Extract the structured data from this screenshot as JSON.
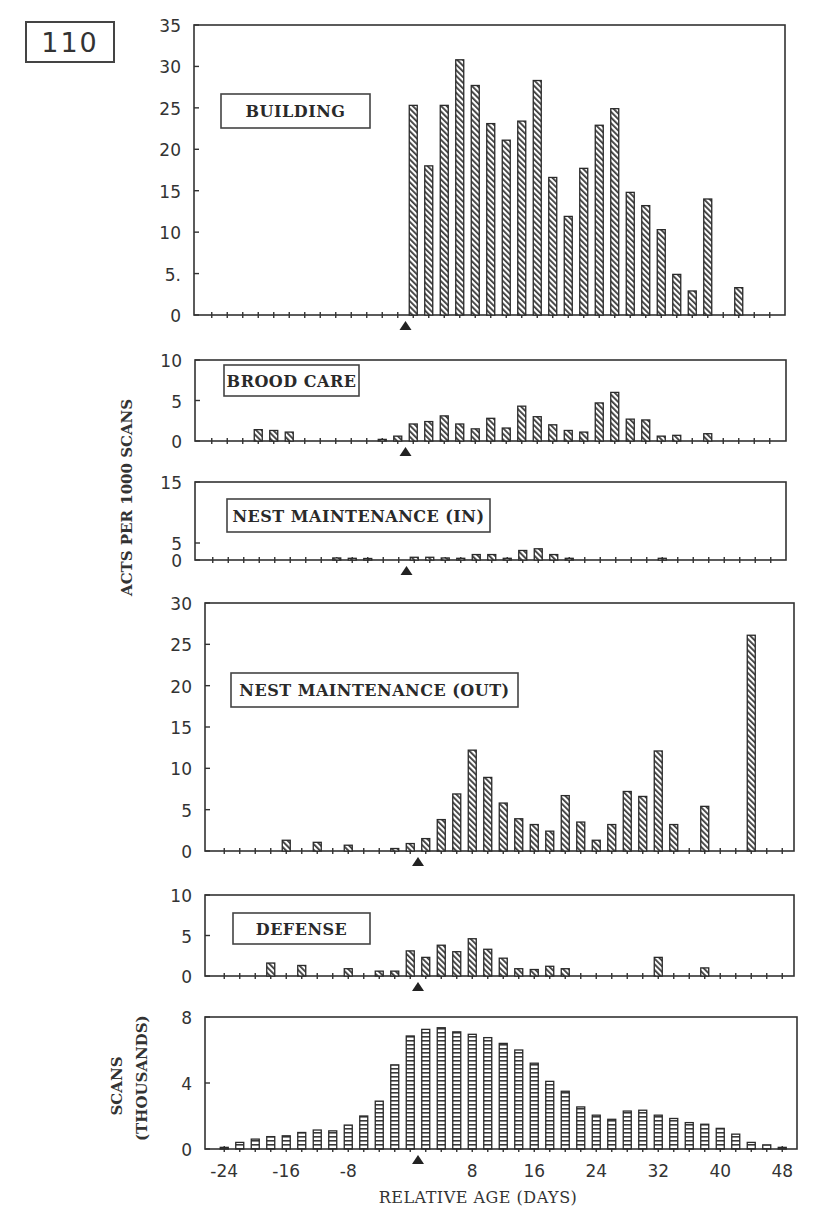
{
  "figure": {
    "number": "110",
    "y_axis_title": "ACTS PER 1000 SCANS",
    "scans_axis_title_line1": "SCANS",
    "scans_axis_title_line2": "(THOUSANDS)",
    "x_axis_title": "RELATIVE AGE (DAYS)",
    "colors": {
      "ink": "#333333",
      "bar_fill": "#ffffff",
      "hatch": "#444444",
      "background": "#ffffff"
    }
  },
  "chart_data": [
    {
      "type": "bar",
      "title": "BUILDING",
      "xlabel": "",
      "ylabel": "ACTS PER 1000 SCANS",
      "ylim": [
        0,
        35
      ],
      "yticks": [
        "0",
        "5.",
        "10",
        "15",
        "20",
        "25",
        "30",
        "35"
      ],
      "grid": false,
      "marker_day": 1,
      "x": [
        2,
        4,
        6,
        8,
        10,
        12,
        14,
        16,
        18,
        20,
        22,
        24,
        26,
        28,
        30,
        32,
        34,
        36,
        38,
        40,
        44
      ],
      "values": [
        25.3,
        18.0,
        25.3,
        30.8,
        27.7,
        23.1,
        21.1,
        23.4,
        28.3,
        16.6,
        11.9,
        17.7,
        22.9,
        24.9,
        14.8,
        13.2,
        10.3,
        4.9,
        2.9,
        14.0,
        3.3
      ]
    },
    {
      "type": "bar",
      "title": "BROOD CARE",
      "ylim": [
        0,
        10
      ],
      "yticks": [
        "0",
        "5",
        "10"
      ],
      "grid": false,
      "marker_day": 1,
      "x": [
        -18,
        -16,
        -14,
        -2,
        0,
        2,
        4,
        6,
        8,
        10,
        12,
        14,
        16,
        18,
        20,
        22,
        24,
        26,
        28,
        30,
        32,
        34,
        36,
        40
      ],
      "values": [
        1.4,
        1.3,
        1.1,
        0.2,
        0.6,
        2.1,
        2.4,
        3.1,
        2.1,
        1.5,
        2.8,
        1.6,
        4.3,
        3.0,
        2.0,
        1.3,
        1.1,
        4.7,
        6.0,
        2.7,
        2.6,
        0.6,
        0.7,
        0.9
      ]
    },
    {
      "type": "bar",
      "title": "NEST MAINTENANCE (IN)",
      "ylim": [
        0,
        15
      ],
      "yticks": [
        "0",
        "5",
        "15"
      ],
      "grid": false,
      "marker_day": 1,
      "x": [
        -8,
        -6,
        -4,
        2,
        4,
        6,
        8,
        10,
        12,
        14,
        16,
        18,
        20,
        22,
        34
      ],
      "values": [
        0.6,
        0.5,
        0.4,
        0.8,
        0.8,
        0.6,
        0.5,
        1.6,
        1.6,
        0.5,
        2.8,
        3.3,
        1.6,
        0.5,
        0.5
      ]
    },
    {
      "type": "bar",
      "title": "NEST MAINTENANCE (OUT)",
      "ylim": [
        0,
        30
      ],
      "yticks": [
        "0",
        "5",
        "10",
        "15",
        "20",
        "25",
        "30"
      ],
      "grid": false,
      "marker_day": 1,
      "x": [
        -16,
        -12,
        -8,
        -2,
        0,
        2,
        4,
        6,
        8,
        10,
        12,
        14,
        16,
        18,
        20,
        22,
        24,
        26,
        28,
        30,
        32,
        34,
        38,
        44
      ],
      "values": [
        1.3,
        1.05,
        0.7,
        0.3,
        0.9,
        1.5,
        3.8,
        6.9,
        12.2,
        8.9,
        5.8,
        3.9,
        3.2,
        2.4,
        6.7,
        3.5,
        1.3,
        3.2,
        7.2,
        6.6,
        12.1,
        3.2,
        5.4,
        26.1
      ]
    },
    {
      "type": "bar",
      "title": "DEFENSE",
      "ylim": [
        0,
        10
      ],
      "yticks": [
        "0",
        "5",
        "10"
      ],
      "grid": false,
      "marker_day": 1,
      "x": [
        -18,
        -14,
        -8,
        -4,
        -2,
        0,
        2,
        4,
        6,
        8,
        10,
        12,
        14,
        16,
        18,
        20,
        32,
        38
      ],
      "values": [
        1.6,
        1.3,
        0.9,
        0.6,
        0.6,
        3.1,
        2.3,
        3.8,
        3.0,
        4.6,
        3.3,
        2.2,
        0.9,
        0.8,
        1.2,
        0.9,
        2.3,
        1.0
      ]
    },
    {
      "type": "bar",
      "title": "",
      "xlabel": "RELATIVE AGE (DAYS)",
      "ylabel": "SCANS (THOUSANDS)",
      "ylim": [
        0,
        8
      ],
      "yticks": [
        "0",
        "4",
        "8"
      ],
      "xticks": [
        "-24",
        "-16",
        "-8",
        "8",
        "16",
        "24",
        "32",
        "40",
        "48"
      ],
      "grid": false,
      "marker_day": 1,
      "x": [
        -24,
        -22,
        -20,
        -18,
        -16,
        -14,
        -12,
        -10,
        -8,
        -6,
        -4,
        -2,
        0,
        2,
        4,
        6,
        8,
        10,
        12,
        14,
        16,
        18,
        20,
        22,
        24,
        26,
        28,
        30,
        32,
        34,
        36,
        38,
        40,
        42,
        44,
        46,
        48
      ],
      "values": [
        0.1,
        0.4,
        0.6,
        0.75,
        0.8,
        1.0,
        1.15,
        1.1,
        1.45,
        2.0,
        2.9,
        5.1,
        6.85,
        7.25,
        7.35,
        7.1,
        6.95,
        6.75,
        6.4,
        6.0,
        5.2,
        4.1,
        3.5,
        2.55,
        2.05,
        1.8,
        2.3,
        2.35,
        2.05,
        1.85,
        1.6,
        1.5,
        1.25,
        0.9,
        0.4,
        0.25,
        0.1
      ]
    }
  ]
}
